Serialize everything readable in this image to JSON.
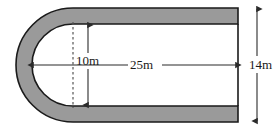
{
  "figure": {
    "name": "u-shaped-track-diagram",
    "colors": {
      "band_fill": "#9a9a9a",
      "outline": "#1a1a1a",
      "background": "#ffffff",
      "dimension_line": "#2b2b2b",
      "dashed_line": "#555555",
      "text": "#1a1a1a"
    },
    "dimensions": [
      {
        "id": "inner-height",
        "label": "10m",
        "orientation": "vertical",
        "arrows": "both",
        "description": "inner width of the track between inner top and inner bottom edges"
      },
      {
        "id": "straight-length",
        "label": "25m",
        "orientation": "horizontal",
        "arrows": "both",
        "description": "horizontal length from inner curve to right open end"
      },
      {
        "id": "outer-height",
        "label": "14m",
        "orientation": "vertical",
        "arrows": "both",
        "description": "total outer height of the figure at the right end"
      }
    ],
    "guides": [
      {
        "id": "tangent-dashed-line",
        "style": "dashed",
        "orientation": "vertical",
        "description": "dashed vertical line marking where the semicircular end meets the straight section"
      }
    ]
  }
}
